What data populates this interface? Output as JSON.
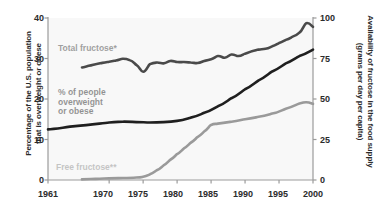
{
  "chart_data": {
    "type": "line",
    "title": "",
    "subtitle": "",
    "xlabel": "",
    "ylabel": "Percentage of the U.S. population that is overweight or obese",
    "y2label": "Availability of fructose in the food supply (grams per day per capita)",
    "xlim": [
      1961,
      2000
    ],
    "ylim": [
      0,
      40
    ],
    "y2lim": [
      0,
      100
    ],
    "xticks": [
      1961,
      1970,
      1975,
      1980,
      1985,
      1990,
      1995,
      2000
    ],
    "xtick_labels": [
      "1961",
      "1970",
      "1975",
      "1980",
      "1985",
      "1990",
      "1995",
      "2000"
    ],
    "yticks": [
      0,
      10,
      20,
      30,
      40
    ],
    "ytick_labels": [
      "0",
      "10",
      "20",
      "30",
      "40"
    ],
    "y2ticks": [
      0,
      25,
      50,
      75,
      100
    ],
    "y2tick_labels": [
      "0",
      "25",
      "50",
      "75",
      "100"
    ],
    "grid": false,
    "legend_position": "inline-annotations",
    "series": [
      {
        "name": "Total fructose*",
        "axis": "right",
        "color": "#4a4a4a",
        "units": "grams per day per capita",
        "x": [
          1966,
          1967,
          1968,
          1969,
          1970,
          1971,
          1972,
          1973,
          1974,
          1975,
          1976,
          1977,
          1978,
          1979,
          1980,
          1981,
          1982,
          1983,
          1984,
          1985,
          1986,
          1987,
          1988,
          1989,
          1990,
          1991,
          1992,
          1993,
          1994,
          1995,
          1996,
          1997,
          1998,
          1999,
          2000
        ],
        "values": [
          69.5,
          70.5,
          71.5,
          72.3,
          73.0,
          73.8,
          74.8,
          74.0,
          71.0,
          66.8,
          71.5,
          72.5,
          72.0,
          73.5,
          72.8,
          72.8,
          72.5,
          72.2,
          73.5,
          74.5,
          76.5,
          75.5,
          77.5,
          76.5,
          78.0,
          79.5,
          80.5,
          81.0,
          82.5,
          84.5,
          86.5,
          88.5,
          91.0,
          96.8,
          94.5
        ]
      },
      {
        "name": "% of people overweight or obese",
        "axis": "left",
        "color": "#1f1f1f",
        "units": "percent",
        "x": [
          1961,
          1965,
          1970,
          1972,
          1974,
          1976,
          1978,
          1980,
          1982,
          1984,
          1986,
          1988,
          1990,
          1992,
          1994,
          1996,
          1998,
          2000
        ],
        "values": [
          12.5,
          13.3,
          14.2,
          14.4,
          14.3,
          14.2,
          14.3,
          14.6,
          15.4,
          16.6,
          18.2,
          20.2,
          22.4,
          24.6,
          26.8,
          28.8,
          30.6,
          32.2
        ]
      },
      {
        "name": "Free fructose**",
        "axis": "right",
        "color": "#9a9a9a",
        "units": "grams per day per capita",
        "x": [
          1966,
          1968,
          1970,
          1972,
          1974,
          1975,
          1976,
          1977,
          1978,
          1979,
          1980,
          1981,
          1982,
          1983,
          1984,
          1985,
          1986,
          1988,
          1990,
          1992,
          1994,
          1996,
          1998,
          1999,
          2000
        ],
        "values": [
          0.4,
          0.7,
          1.0,
          1.2,
          1.5,
          2.0,
          3.5,
          6.0,
          9.0,
          12.5,
          16.0,
          19.5,
          23.0,
          26.5,
          30.0,
          34.0,
          34.8,
          36.0,
          37.5,
          39.0,
          41.0,
          44.0,
          47.2,
          48.0,
          47.0
        ]
      }
    ],
    "annotations": [
      {
        "text": "Total fructose*",
        "series": "Total fructose*"
      },
      {
        "text": "% of people\noverweight\nor obese",
        "series": "% of people overweight or obese"
      },
      {
        "text": "Free fructose**",
        "series": "Free fructose**"
      }
    ]
  },
  "axes": {
    "left": {
      "title": "Percentage of the U.S. population\nthat is overweight or obese",
      "ticks": [
        "40",
        "30",
        "20",
        "10",
        "0"
      ]
    },
    "right": {
      "title": "Availability of fructose in the food supply\n(grams per day per capita)",
      "ticks": [
        "100",
        "75",
        "50",
        "25",
        "0"
      ]
    },
    "bottom": {
      "ticks": [
        "1961",
        "1970",
        "1975",
        "1980",
        "1985",
        "1990",
        "1995",
        "2000"
      ]
    }
  },
  "labels": {
    "total_fructose": "Total fructose*",
    "overweight": "% of people\noverweight\nor obese",
    "free_fructose": "Free fructose**"
  },
  "colors": {
    "total_fructose": "#4a4a4a",
    "overweight": "#1f1f1f",
    "free_fructose": "#9a9a9a",
    "axis": "#9b9b9b",
    "text": "#2b2b2b",
    "plot_fill": "#f2f2f2",
    "background": "#ffffff"
  }
}
